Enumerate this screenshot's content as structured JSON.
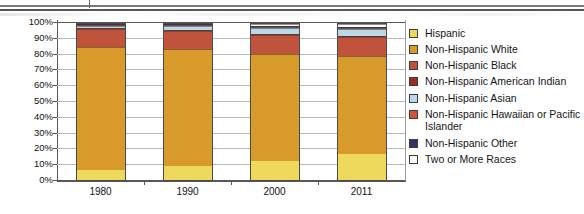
{
  "document": {
    "top_rules": "double-horizontal-rule"
  },
  "chart_data": {
    "type": "bar",
    "stacked": true,
    "title": "",
    "subtitle": "",
    "xlabel": "",
    "ylabel": "",
    "ylim": [
      0,
      100
    ],
    "grid": true,
    "legend_position": "right",
    "categories": [
      "1980",
      "1990",
      "2000",
      "2011"
    ],
    "y_ticks": [
      "0%",
      "10%",
      "20%",
      "30%",
      "40%",
      "50%",
      "60%",
      "70%",
      "80%",
      "90%",
      "100%"
    ],
    "series": [
      {
        "name": "Hispanic",
        "color": "#efd95c",
        "values": [
          6.4,
          9.0,
          12.5,
          16.7
        ]
      },
      {
        "name": "Non-Hispanic White",
        "color": "#d89a2a",
        "values": [
          79.6,
          75.7,
          69.1,
          63.4
        ]
      },
      {
        "name": "Non-Hispanic Black",
        "color": "#c0533c",
        "values": [
          11.5,
          11.8,
          12.1,
          12.3
        ]
      },
      {
        "name": "Non-Hispanic American Indian",
        "color": "#9e2b20",
        "values": [
          0.6,
          0.7,
          0.7,
          0.7
        ]
      },
      {
        "name": "Non-Hispanic Asian",
        "color": "#b9d9e8",
        "values": [
          1.5,
          2.5,
          3.6,
          4.8
        ]
      },
      {
        "name": "Non-Hispanic Hawaiian or Pacific Islander",
        "color": "#d4543a",
        "values": [
          0.2,
          0.2,
          0.2,
          0.2
        ]
      },
      {
        "name": "Non-Hispanic Other",
        "color": "#2f3560",
        "values": [
          0.2,
          0.1,
          0.3,
          0.2
        ]
      },
      {
        "name": "Two or More Races",
        "color": "#fbfbf6",
        "values": [
          0.0,
          0.0,
          1.5,
          1.7
        ]
      }
    ]
  }
}
